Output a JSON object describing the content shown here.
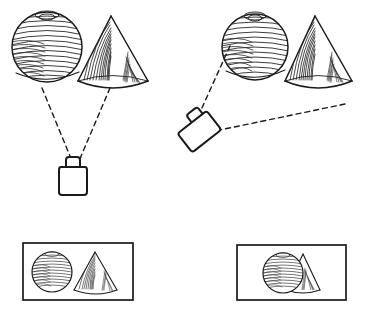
{
  "figure": {
    "title": "Two camera viewpoints of a sphere-and-cone scene",
    "description": "Two line-drawn viewpoints: a camera directly below a sphere and cone sees them separated; an obliquely placed camera sees the sphere overlapping the cone.",
    "background_color": "#ffffff",
    "ink_color": "#1a1a1a",
    "shading_color": "#4a4a4a"
  },
  "scenes": [
    {
      "id": "left-scene",
      "name": "Frontal viewpoint",
      "sphere_label": "sphere",
      "cone_label": "cone",
      "camera_label": "camera",
      "camera_orientation": "upright",
      "sight_lines": 2,
      "sphere": {
        "cx": 47,
        "cy": 47,
        "r": 36
      },
      "cone": {
        "apex_x": 111,
        "apex_y": 16,
        "base_left_x": 78,
        "base_right_x": 148,
        "base_y": 83
      },
      "camera": {
        "x": 60,
        "y": 165,
        "w": 30,
        "h": 30
      },
      "rays": [
        {
          "from_x": 42,
          "from_y": 88,
          "to_x": 72,
          "to_y": 163
        },
        {
          "from_x": 110,
          "from_y": 88,
          "to_x": 78,
          "to_y": 163
        }
      ]
    },
    {
      "id": "right-scene",
      "name": "Oblique viewpoint",
      "sphere_label": "sphere",
      "cone_label": "cone",
      "camera_label": "camera",
      "camera_orientation": "tilted",
      "sight_lines": 2,
      "sphere": {
        "cx": 255,
        "cy": 47,
        "r": 34
      },
      "cone": {
        "apex_x": 315,
        "apex_y": 16,
        "base_left_x": 285,
        "base_right_x": 352,
        "base_y": 83
      },
      "camera": {
        "x": 178,
        "y": 113,
        "w": 32,
        "h": 30,
        "rotation_deg": -38
      },
      "rays": [
        {
          "from_x": 229,
          "from_y": 47,
          "to_x": 196,
          "to_y": 122
        },
        {
          "from_x": 345,
          "from_y": 104,
          "to_x": 214,
          "to_y": 130
        }
      ]
    }
  ],
  "rendered_views": [
    {
      "id": "left-view",
      "name": "view-from-frontal-camera",
      "caption": "",
      "frame": {
        "x": 23,
        "y": 243,
        "w": 110,
        "h": 57
      },
      "arrangement": "sphere and cone side by side, not overlapping",
      "sphere": {
        "cx": 52,
        "cy": 272,
        "r": 21
      },
      "cone": {
        "apex_x": 95,
        "apex_y": 252,
        "base_left_x": 74,
        "base_right_x": 117,
        "base_y": 291
      }
    },
    {
      "id": "right-view",
      "name": "view-from-oblique-camera",
      "caption": "",
      "frame": {
        "x": 237,
        "y": 245,
        "w": 109,
        "h": 55
      },
      "arrangement": "sphere overlaps and occludes most of the cone",
      "sphere": {
        "cx": 283,
        "cy": 273,
        "r": 21
      },
      "cone": {
        "apex_x": 303,
        "apex_y": 254,
        "base_left_x": 286,
        "base_right_x": 320,
        "base_y": 290
      }
    }
  ],
  "style": {
    "dash_pattern": "5 4",
    "stroke_width": 1.4,
    "frame_stroke_width": 1.6
  }
}
